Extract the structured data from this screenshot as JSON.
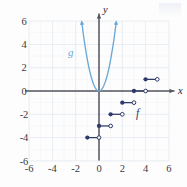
{
  "figure": {
    "background_color": "#fdfdfd",
    "grid_color": "#dfe6ef",
    "axis_color": "#55555f",
    "width": 187,
    "height": 187
  },
  "axes": {
    "x_axis_label": "x",
    "y_axis_label": "y",
    "x_ticks": [
      "-6",
      "-4",
      "-2",
      "0",
      "2",
      "4",
      "6"
    ],
    "x_tick_values": [
      -6,
      -4,
      -2,
      0,
      2,
      4,
      6
    ],
    "y_ticks": [
      "6",
      "4",
      "2",
      "0",
      "-2",
      "-4",
      "-6"
    ],
    "y_tick_values": [
      6,
      4,
      2,
      0,
      -2,
      -4,
      -6
    ],
    "xlim": [
      -6,
      6
    ],
    "ylim": [
      -6,
      6
    ],
    "grid": true
  },
  "labels": {
    "g_label": "g",
    "g_color": "#6ba8d6",
    "f_label": "f",
    "f_color": "#2d3a6b"
  },
  "chart_data": {
    "type": "line",
    "title": "",
    "xlabel": "x",
    "ylabel": "y",
    "xlim": [
      -6,
      6
    ],
    "ylim": [
      -6,
      6
    ],
    "grid": true,
    "legend": "inline-curve-labels",
    "series": [
      {
        "name": "g",
        "kind": "parabola",
        "color": "#6ba8d6",
        "equation": "g(x) = 2.7x^2",
        "coefficient": 2.7,
        "vertex": [
          0,
          0
        ],
        "x_range": [
          -1.5,
          1.5
        ],
        "arrow_ends": true,
        "points": [
          [
            -1.5,
            6.0
          ],
          [
            -1.25,
            4.2
          ],
          [
            -1.0,
            2.7
          ],
          [
            -0.75,
            1.52
          ],
          [
            -0.5,
            0.68
          ],
          [
            -0.25,
            0.17
          ],
          [
            0,
            0
          ],
          [
            0.25,
            0.17
          ],
          [
            0.5,
            0.68
          ],
          [
            0.75,
            1.52
          ],
          [
            1.0,
            2.7
          ],
          [
            1.25,
            4.2
          ],
          [
            1.5,
            6.0
          ]
        ]
      },
      {
        "name": "f",
        "kind": "step",
        "color": "#2d3a6b",
        "description": "step function, half-open intervals closed on the left",
        "steps": [
          {
            "x_start": -1,
            "x_end": 0,
            "y": -4,
            "left_closed": true,
            "right_closed": false
          },
          {
            "x_start": 0,
            "x_end": 1,
            "y": -3,
            "left_closed": true,
            "right_closed": false
          },
          {
            "x_start": 1,
            "x_end": 2,
            "y": -2,
            "left_closed": true,
            "right_closed": false
          },
          {
            "x_start": 2,
            "x_end": 3,
            "y": -1,
            "left_closed": true,
            "right_closed": false
          },
          {
            "x_start": 3,
            "x_end": 4,
            "y": 0,
            "left_closed": true,
            "right_closed": false
          },
          {
            "x_start": 4,
            "x_end": 5,
            "y": 1,
            "left_closed": true,
            "right_closed": false
          }
        ]
      }
    ]
  }
}
